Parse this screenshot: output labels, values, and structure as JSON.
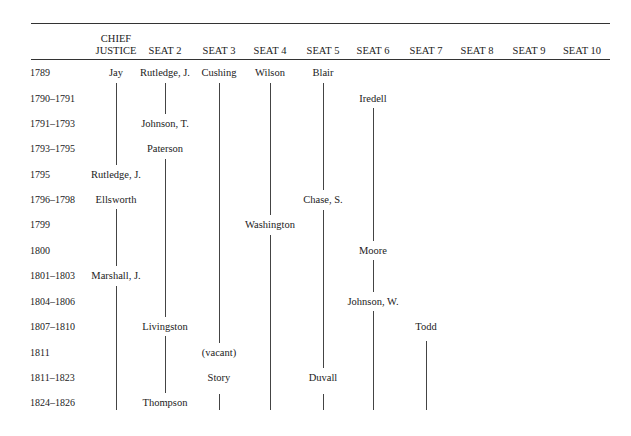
{
  "table": {
    "columns": [
      {
        "id": "cj",
        "label_line1": "CHIEF",
        "label_line2": "JUSTICE",
        "x": 116
      },
      {
        "id": "s2",
        "label_line1": "",
        "label_line2": "SEAT 2",
        "x": 165
      },
      {
        "id": "s3",
        "label_line1": "",
        "label_line2": "SEAT 3",
        "x": 219
      },
      {
        "id": "s4",
        "label_line1": "",
        "label_line2": "SEAT 4",
        "x": 270
      },
      {
        "id": "s5",
        "label_line1": "",
        "label_line2": "SEAT 5",
        "x": 323
      },
      {
        "id": "s6",
        "label_line1": "",
        "label_line2": "SEAT 6",
        "x": 373
      },
      {
        "id": "s7",
        "label_line1": "",
        "label_line2": "SEAT 7",
        "x": 426
      },
      {
        "id": "s8",
        "label_line1": "",
        "label_line2": "SEAT 8",
        "x": 477
      },
      {
        "id": "s9",
        "label_line1": "",
        "label_line2": "SEAT 9",
        "x": 529
      },
      {
        "id": "s10",
        "label_line1": "",
        "label_line2": "SEAT 10",
        "x": 582
      }
    ],
    "rows": [
      {
        "years": "1789",
        "y": 72
      },
      {
        "years": "1790–1791",
        "y": 98
      },
      {
        "years": "1791–1793",
        "y": 123
      },
      {
        "years": "1793–1795",
        "y": 148
      },
      {
        "years": "1795",
        "y": 174
      },
      {
        "years": "1796–1798",
        "y": 199
      },
      {
        "years": "1799",
        "y": 224
      },
      {
        "years": "1800",
        "y": 250
      },
      {
        "years": "1801–1803",
        "y": 275
      },
      {
        "years": "1804–1806",
        "y": 301
      },
      {
        "years": "1807–1810",
        "y": 326
      },
      {
        "years": "1811",
        "y": 352
      },
      {
        "years": "1811–1823",
        "y": 377
      },
      {
        "years": "1824–1826",
        "y": 402
      }
    ],
    "justices": [
      {
        "name": "Jay",
        "col": 0,
        "row": 0
      },
      {
        "name": "Rutledge, J.",
        "col": 0,
        "row": 4
      },
      {
        "name": "Ellsworth",
        "col": 0,
        "row": 5
      },
      {
        "name": "Marshall, J.",
        "col": 0,
        "row": 8
      },
      {
        "name": "Rutledge, J.",
        "col": 1,
        "row": 0
      },
      {
        "name": "Johnson, T.",
        "col": 1,
        "row": 2
      },
      {
        "name": "Paterson",
        "col": 1,
        "row": 3
      },
      {
        "name": "Livingston",
        "col": 1,
        "row": 10
      },
      {
        "name": "Thompson",
        "col": 1,
        "row": 13
      },
      {
        "name": "Cushing",
        "col": 2,
        "row": 0
      },
      {
        "name": "(vacant)",
        "col": 2,
        "row": 11
      },
      {
        "name": "Story",
        "col": 2,
        "row": 12
      },
      {
        "name": "Wilson",
        "col": 3,
        "row": 0
      },
      {
        "name": "Washington",
        "col": 3,
        "row": 6
      },
      {
        "name": "Blair",
        "col": 4,
        "row": 0
      },
      {
        "name": "Chase, S.",
        "col": 4,
        "row": 5
      },
      {
        "name": "Duvall",
        "col": 4,
        "row": 12
      },
      {
        "name": "Iredell",
        "col": 5,
        "row": 1
      },
      {
        "name": "Moore",
        "col": 5,
        "row": 7
      },
      {
        "name": "Johnson, W.",
        "col": 5,
        "row": 9
      },
      {
        "name": "Todd",
        "col": 6,
        "row": 10
      }
    ],
    "segments": [
      {
        "col": 0,
        "y1": 83,
        "y2": 165
      },
      {
        "col": 0,
        "y1": 209,
        "y2": 266
      },
      {
        "col": 0,
        "y1": 286,
        "y2": 410
      },
      {
        "col": 1,
        "y1": 83,
        "y2": 114
      },
      {
        "col": 1,
        "y1": 159,
        "y2": 317
      },
      {
        "col": 1,
        "y1": 336,
        "y2": 393
      },
      {
        "col": 2,
        "y1": 83,
        "y2": 343
      },
      {
        "col": 2,
        "y1": 394,
        "y2": 410
      },
      {
        "col": 3,
        "y1": 83,
        "y2": 215
      },
      {
        "col": 3,
        "y1": 235,
        "y2": 410
      },
      {
        "col": 4,
        "y1": 83,
        "y2": 190
      },
      {
        "col": 4,
        "y1": 210,
        "y2": 368
      },
      {
        "col": 4,
        "y1": 394,
        "y2": 410
      },
      {
        "col": 5,
        "y1": 108,
        "y2": 241
      },
      {
        "col": 5,
        "y1": 260,
        "y2": 292
      },
      {
        "col": 5,
        "y1": 311,
        "y2": 410
      },
      {
        "col": 6,
        "y1": 341,
        "y2": 410
      }
    ]
  }
}
